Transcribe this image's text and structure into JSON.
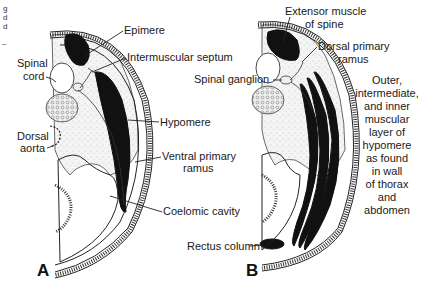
{
  "figure": {
    "panels": [
      {
        "letter": "A",
        "labels": {
          "epimere": "Epimere",
          "intermuscular_septum": "Intermuscular septum",
          "spinal_cord_1": "Spinal",
          "spinal_cord_2": "cord",
          "hypomere": "Hypomere",
          "dorsal_aorta_1": "Dorsal",
          "dorsal_aorta_2": "aorta",
          "ventral_ramus_1": "Ventral primary",
          "ventral_ramus_2": "ramus",
          "coelomic_cavity": "Coelomic cavity"
        }
      },
      {
        "letter": "B",
        "labels": {
          "extensor_1": "Extensor muscle",
          "extensor_2": "of spine",
          "dorsal_ramus_1": "Dorsal primary",
          "dorsal_ramus_2": "ramus",
          "spinal_ganglion": "Spinal ganglion",
          "layers": [
            "Outer,",
            "intermediate,",
            "and inner",
            "muscular",
            "layer of",
            "hypomere",
            "as found",
            "in wall",
            "of thorax",
            "and",
            "abdomen"
          ],
          "rectus_column": "Rectus column"
        }
      }
    ],
    "cropped_caption_fragments": [
      "g",
      "d",
      "d",
      "–"
    ]
  }
}
